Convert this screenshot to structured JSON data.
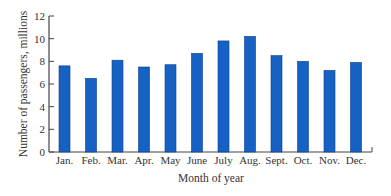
{
  "chart_data": {
    "type": "bar",
    "title": "",
    "xlabel": "Month of year",
    "ylabel": "Number of passengers, millions",
    "categories": [
      "Jan.",
      "Feb.",
      "Mar.",
      "Apr.",
      "May",
      "June",
      "July",
      "Aug.",
      "Sept.",
      "Oct.",
      "Nov.",
      "Dec."
    ],
    "values": [
      7.6,
      6.5,
      8.1,
      7.5,
      7.7,
      8.7,
      9.8,
      10.2,
      8.5,
      8.0,
      7.2,
      7.9
    ],
    "ylim": [
      0,
      12
    ],
    "yticks": [
      0,
      2,
      4,
      6,
      8,
      10,
      12
    ],
    "grid": false,
    "legend": null,
    "colors": {
      "bar": "#1562C4",
      "bar_edge": "#0B3F8A",
      "axis": "#444444"
    }
  }
}
